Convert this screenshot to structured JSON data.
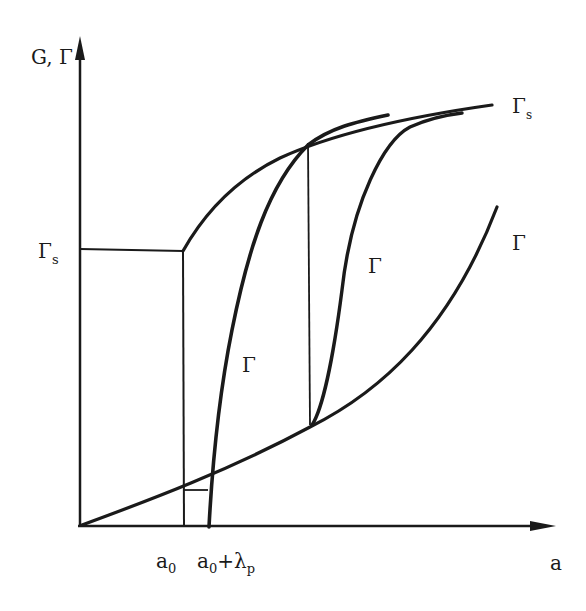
{
  "diagram": {
    "type": "R-curve / crack growth resistance diagram",
    "axes": {
      "y_label": "G, Γ",
      "x_label": "a"
    },
    "y_ticks": [
      {
        "label": "Γ",
        "sub": "s",
        "position": "level of steady-state toughness"
      }
    ],
    "x_ticks": [
      {
        "label": "a",
        "sub": "0"
      },
      {
        "label": "a",
        "sub": "0",
        "suffix": "+λ",
        "suffix_sub": "p"
      }
    ],
    "curve_labels": {
      "upper_envelope": {
        "label": "Γ",
        "sub": "s"
      },
      "r_curve_left": {
        "label": "Γ"
      },
      "r_curve_mid": {
        "label": "Γ"
      },
      "r_curve_right": {
        "label": "Γ"
      }
    },
    "colors": {
      "ink": "#1a1a1a",
      "background": "#ffffff"
    }
  }
}
